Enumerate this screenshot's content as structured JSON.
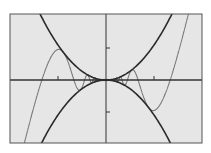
{
  "colors": {
    "background": "#ffffff",
    "plot_fill": "#e6e6e6",
    "frame": "#555555",
    "axes": "#333333",
    "envelope": "#2a2a2a",
    "oscillating_curve": "#7a7a7a"
  },
  "chart_data": {
    "type": "line",
    "title": "",
    "xlabel": "",
    "ylabel": "",
    "xlim": [
      -2.0,
      2.0
    ],
    "ylim": [
      -1.9,
      1.9
    ],
    "grid": false,
    "legend": null,
    "x_ticks": [
      -1,
      1
    ],
    "y_ticks": [
      -1,
      1
    ],
    "series": [
      {
        "name": "upper envelope",
        "formula": "y = x^2",
        "style": "dark, thick"
      },
      {
        "name": "lower envelope",
        "formula": "y = -x^2",
        "style": "dark, thick"
      },
      {
        "name": "oscillating curve",
        "formula": "y = x^2 * sin(a / x)",
        "style": "gray, thin",
        "note": "oscillates between envelopes with increasing frequency near origin"
      }
    ]
  }
}
